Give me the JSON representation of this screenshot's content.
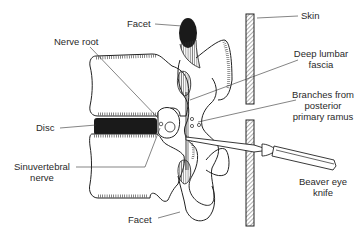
{
  "figure": {
    "type": "anatomical-diagram",
    "colors": {
      "ink": "#222222",
      "fill_dark": "#1a1a1a",
      "background": "#ffffff"
    }
  },
  "labels": {
    "facet_top": "Facet",
    "nerve_root": "Nerve root",
    "skin": "Skin",
    "deep_lumbar_fascia_1": "Deep lumbar",
    "deep_lumbar_fascia_2": "fascia",
    "branches_1": "Branches from",
    "branches_2": "posterior",
    "branches_3": "primary ramus",
    "disc": "Disc",
    "sinuvertebral_1": "Sinuvertebral",
    "sinuvertebral_2": "nerve",
    "beaver_1": "Beaver eye",
    "beaver_2": "knife",
    "facet_bottom": "Facet"
  }
}
